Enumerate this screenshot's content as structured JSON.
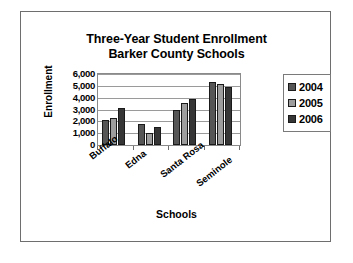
{
  "chart_data": {
    "type": "bar",
    "title": "Three-Year Student Enrollment",
    "subtitle": "Barker County Schools",
    "xlabel": "Schools",
    "ylabel": "Enrollment",
    "categories": [
      "Buffalo",
      "Edna",
      "Santa Rosa",
      "Seminole"
    ],
    "series": [
      {
        "name": "2004",
        "color": "#565656",
        "values": [
          2100,
          1800,
          2950,
          5300
        ]
      },
      {
        "name": "2005",
        "color": "#9d9d9d",
        "values": [
          2250,
          1000,
          3550,
          5150
        ]
      },
      {
        "name": "2006",
        "color": "#363636",
        "values": [
          3100,
          1500,
          3900,
          4900
        ]
      }
    ],
    "ylim": [
      0,
      6000
    ],
    "yticks": [
      6000,
      5000,
      4000,
      3000,
      2000,
      1000,
      0
    ],
    "ytick_labels": [
      "6,000",
      "5,000",
      "4,000",
      "3,000",
      "2,000",
      "1,000",
      "0"
    ],
    "grid": true,
    "legend_position": "right"
  }
}
